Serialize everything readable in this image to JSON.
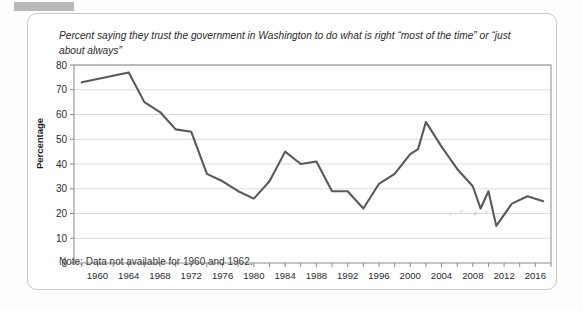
{
  "card": {
    "title": "Percent saying they trust the government in Washington to do what is right “most of the time” or “just about always”",
    "note": "Note: Data not available for 1960 and 1962."
  },
  "colors": {
    "line": "#595959",
    "grid": "#dcdcdc",
    "axis": "#8a8a8a",
    "card_border": "#c9c9c9",
    "text": "#2b2b2b",
    "top_tab": "#b9b9b9"
  },
  "chart_data": {
    "type": "line",
    "title": "Percent saying they trust the government in Washington to do what is right “most of the time” or “just about always”",
    "xlabel": "",
    "ylabel": "Percentage",
    "ylim": [
      0,
      80
    ],
    "xlim": [
      1957,
      2018
    ],
    "ytick_labels": [
      "0",
      "10",
      "20",
      "30",
      "40",
      "50",
      "60",
      "70",
      "80"
    ],
    "yticks": [
      0,
      10,
      20,
      30,
      40,
      50,
      60,
      70,
      80
    ],
    "xtick_labels": [
      "1960",
      "1964",
      "1968",
      "1972",
      "1976",
      "1980",
      "1984",
      "1988",
      "1992",
      "1996",
      "2000",
      "2004",
      "2008",
      "2012",
      "2016"
    ],
    "xticks_labeled": [
      1960,
      1964,
      1968,
      1972,
      1976,
      1980,
      1984,
      1988,
      1992,
      1996,
      2000,
      2004,
      2008,
      2012,
      2016
    ],
    "xticks_minor_step": 2,
    "grid": "horizontal",
    "legend": "none",
    "annotation": "Note: Data not available for 1960 and 1962.",
    "series": [
      {
        "name": "Trust the government in Washington",
        "x": [
          1958,
          1964,
          1966,
          1968,
          1970,
          1972,
          1974,
          1976,
          1978,
          1980,
          1982,
          1984,
          1986,
          1988,
          1990,
          1992,
          1994,
          1996,
          1998,
          2000,
          2001,
          2002,
          2004,
          2006,
          2008,
          2009,
          2010,
          2011,
          2013,
          2015,
          2017
        ],
        "values": [
          73,
          77,
          65,
          61,
          54,
          53,
          36,
          33,
          29,
          26,
          33,
          45,
          40,
          41,
          29,
          29,
          22,
          32,
          36,
          44,
          46,
          57,
          47,
          38,
          31,
          22,
          29,
          15,
          24,
          27,
          25
        ]
      }
    ]
  }
}
